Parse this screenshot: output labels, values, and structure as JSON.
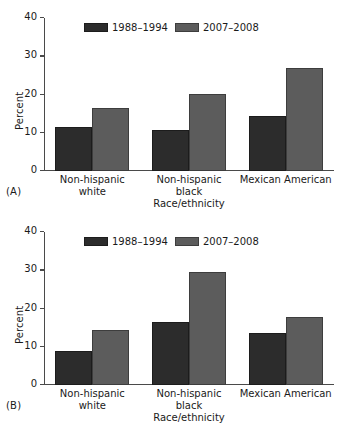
{
  "figure": {
    "panels": [
      {
        "tag": "(A)",
        "chart_data": {
          "type": "bar",
          "title": "",
          "categories": [
            "Non-hispanic\nwhite",
            "Non-hispanic\nblack",
            "Mexican American"
          ],
          "series": [
            {
              "name": "1988–1994",
              "values": [
                11.5,
                10.8,
                14.3
              ],
              "color": "#2c2c2c"
            },
            {
              "name": "2007–2008",
              "values": [
                16.5,
                20.1,
                27.0
              ],
              "color": "#5c5c5c"
            }
          ],
          "xlabel": "Race/ethnicity",
          "ylabel": "Percent",
          "ylim": [
            0,
            40
          ],
          "yticks": [
            0,
            10,
            20,
            30,
            40
          ],
          "ytick_labels": [
            "0",
            "10",
            "20",
            "30",
            "40"
          ],
          "grid": false,
          "legend_position": "top-center"
        }
      },
      {
        "tag": "(B)",
        "chart_data": {
          "type": "bar",
          "title": "",
          "categories": [
            "Non-hispanic\nwhite",
            "Non-hispanic\nblack",
            "Mexican American"
          ],
          "series": [
            {
              "name": "1988–1994",
              "values": [
                8.8,
                16.4,
                13.7
              ],
              "color": "#2c2c2c"
            },
            {
              "name": "2007–2008",
              "values": [
                14.4,
                29.6,
                17.9
              ],
              "color": "#5c5c5c"
            }
          ],
          "xlabel": "Race/ethnicity",
          "ylabel": "Percent",
          "ylim": [
            0,
            40
          ],
          "yticks": [
            0,
            10,
            20,
            30,
            40
          ],
          "ytick_labels": [
            "0",
            "10",
            "20",
            "30",
            "40"
          ],
          "grid": false,
          "legend_position": "top-center"
        }
      }
    ]
  }
}
